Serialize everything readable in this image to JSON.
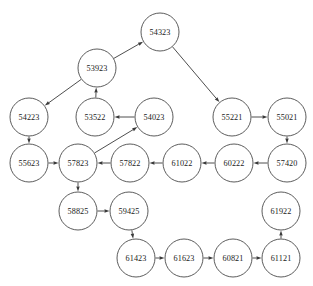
{
  "diagram": {
    "width": 313,
    "height": 286,
    "node_radius": 19,
    "colors": {
      "background": "#ffffff",
      "node_fill": "#ffffff",
      "node_stroke": "#4a4a4a",
      "edge_stroke": "#3a3a3a",
      "label_color": "#1a1a1a"
    },
    "nodes": [
      {
        "id": "54323",
        "label": "54323",
        "x": 160,
        "y": 32
      },
      {
        "id": "53923",
        "label": "53923",
        "x": 97,
        "y": 68
      },
      {
        "id": "54223",
        "label": "54223",
        "x": 29,
        "y": 117
      },
      {
        "id": "53522",
        "label": "53522",
        "x": 95,
        "y": 117
      },
      {
        "id": "54023",
        "label": "54023",
        "x": 154,
        "y": 117
      },
      {
        "id": "55221",
        "label": "55221",
        "x": 232,
        "y": 117
      },
      {
        "id": "55021",
        "label": "55021",
        "x": 287,
        "y": 117
      },
      {
        "id": "55623",
        "label": "55623",
        "x": 29,
        "y": 163
      },
      {
        "id": "57823",
        "label": "57823",
        "x": 78,
        "y": 163
      },
      {
        "id": "57822",
        "label": "57822",
        "x": 130,
        "y": 163
      },
      {
        "id": "61022",
        "label": "61022",
        "x": 182,
        "y": 163
      },
      {
        "id": "60222",
        "label": "60222",
        "x": 234,
        "y": 163
      },
      {
        "id": "57420",
        "label": "57420",
        "x": 287,
        "y": 163
      },
      {
        "id": "58825",
        "label": "58825",
        "x": 78,
        "y": 211
      },
      {
        "id": "59425",
        "label": "59425",
        "x": 129,
        "y": 211
      },
      {
        "id": "61922",
        "label": "61922",
        "x": 281,
        "y": 211
      },
      {
        "id": "61423",
        "label": "61423",
        "x": 136,
        "y": 258
      },
      {
        "id": "61623",
        "label": "61623",
        "x": 184,
        "y": 258
      },
      {
        "id": "60821",
        "label": "60821",
        "x": 233,
        "y": 258
      },
      {
        "id": "61121",
        "label": "61121",
        "x": 281,
        "y": 258
      }
    ],
    "edges": [
      {
        "from": "53923",
        "to": "54323"
      },
      {
        "from": "54323",
        "to": "55221"
      },
      {
        "from": "53923",
        "to": "54223"
      },
      {
        "from": "53522",
        "to": "53923"
      },
      {
        "from": "54023",
        "to": "53522"
      },
      {
        "from": "54223",
        "to": "55623"
      },
      {
        "from": "55221",
        "to": "55021"
      },
      {
        "from": "55021",
        "to": "57420"
      },
      {
        "from": "57420",
        "to": "60222"
      },
      {
        "from": "60222",
        "to": "61022"
      },
      {
        "from": "61022",
        "to": "57822"
      },
      {
        "from": "57822",
        "to": "57823"
      },
      {
        "from": "55623",
        "to": "57823"
      },
      {
        "from": "57823",
        "to": "54023"
      },
      {
        "from": "57823",
        "to": "58825"
      },
      {
        "from": "58825",
        "to": "59425"
      },
      {
        "from": "59425",
        "to": "61423"
      },
      {
        "from": "61423",
        "to": "61623"
      },
      {
        "from": "61623",
        "to": "60821"
      },
      {
        "from": "60821",
        "to": "61121"
      },
      {
        "from": "61121",
        "to": "61922"
      }
    ]
  }
}
